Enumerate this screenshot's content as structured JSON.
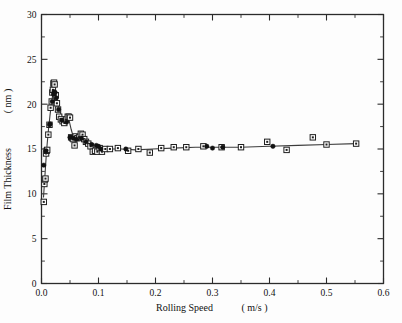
{
  "figure": {
    "background": "#fdfdfd",
    "frame_color": "#2b2b2b",
    "marker_square_label": "open-square-with-center-dot",
    "marker_circle_label": "filled-circle"
  },
  "chart_data": {
    "type": "scatter",
    "title": "",
    "xlabel_name": "Rolling Speed",
    "xlabel_units": "( m/s )",
    "ylabel_name": "Film Thickness",
    "ylabel_units": "( nm )",
    "xlim": [
      0.0,
      0.6
    ],
    "ylim": [
      0,
      30
    ],
    "xticks": [
      0.0,
      0.1,
      0.2,
      0.3,
      0.4,
      0.5,
      0.6
    ],
    "xtick_labels": [
      "0.0",
      "0.1",
      "0.2",
      "0.3",
      "0.4",
      "0.5",
      "0.6"
    ],
    "yticks": [
      0,
      5,
      10,
      15,
      20,
      25,
      30
    ],
    "ytick_labels": [
      "0",
      "5",
      "10",
      "15",
      "20",
      "25",
      "30"
    ],
    "x_minor_step": 0.05,
    "y_minor_step": 2.5,
    "grid": false,
    "legend": "none",
    "tick_direction": "in",
    "series": [
      {
        "name": "squares",
        "marker": "open-square-with-center-dot",
        "x": [
          0.004,
          0.005,
          0.006,
          0.007,
          0.008,
          0.009,
          0.01,
          0.012,
          0.014,
          0.016,
          0.018,
          0.019,
          0.02,
          0.021,
          0.022,
          0.023,
          0.025,
          0.027,
          0.029,
          0.031,
          0.034,
          0.037,
          0.04,
          0.043,
          0.046,
          0.048,
          0.05,
          0.052,
          0.054,
          0.056,
          0.058,
          0.06,
          0.063,
          0.066,
          0.069,
          0.072,
          0.075,
          0.078,
          0.082,
          0.086,
          0.09,
          0.094,
          0.098,
          0.102,
          0.106,
          0.112,
          0.12,
          0.134,
          0.152,
          0.17,
          0.19,
          0.21,
          0.232,
          0.254,
          0.284,
          0.316,
          0.35,
          0.396,
          0.43,
          0.476,
          0.5,
          0.552
        ],
        "y": [
          9.1,
          11.1,
          11.6,
          11.7,
          14.5,
          14.8,
          14.9,
          16.6,
          17.7,
          19.6,
          20.3,
          21.3,
          21.6,
          22.3,
          22.4,
          22.2,
          21.0,
          20.1,
          19.4,
          18.6,
          18.3,
          18.1,
          17.9,
          18.3,
          18.6,
          18.6,
          18.5,
          16.3,
          16.2,
          16.1,
          15.4,
          16.4,
          16.2,
          16.3,
          16.7,
          16.6,
          16.1,
          15.8,
          15.6,
          15.3,
          14.7,
          14.8,
          14.7,
          15.1,
          14.7,
          15.0,
          15.0,
          15.1,
          14.8,
          15.0,
          14.6,
          15.1,
          15.2,
          15.2,
          15.3,
          15.2,
          15.2,
          15.8,
          14.9,
          16.3,
          15.5,
          15.6
        ]
      },
      {
        "name": "circles",
        "marker": "filled-circle",
        "x": [
          0.004,
          0.008,
          0.014,
          0.015,
          0.019,
          0.021,
          0.022,
          0.024,
          0.026,
          0.03,
          0.036,
          0.044,
          0.05,
          0.056,
          0.062,
          0.07,
          0.078,
          0.088,
          0.096,
          0.1,
          0.104,
          0.148,
          0.29,
          0.3,
          0.318,
          0.406
        ],
        "y": [
          13.2,
          14.8,
          17.7,
          17.8,
          20.3,
          21.1,
          21.4,
          21.3,
          20.7,
          19.4,
          18.2,
          18.0,
          16.3,
          16.2,
          16.1,
          16.2,
          15.8,
          15.5,
          15.4,
          15.3,
          15.0,
          15.0,
          15.3,
          15.1,
          15.2,
          15.3
        ]
      }
    ],
    "fit_curve": {
      "name": "trend-line",
      "x": [
        0.0035,
        0.006,
        0.009,
        0.012,
        0.015,
        0.018,
        0.02,
        0.022,
        0.024,
        0.027,
        0.03,
        0.034,
        0.038,
        0.043,
        0.048,
        0.052,
        0.056,
        0.06,
        0.065,
        0.07,
        0.076,
        0.082,
        0.09,
        0.098,
        0.108,
        0.12,
        0.14,
        0.165,
        0.195,
        0.23,
        0.27,
        0.31,
        0.35,
        0.4,
        0.45,
        0.5,
        0.552
      ],
      "y": [
        9.6,
        12.0,
        14.9,
        17.0,
        18.8,
        20.3,
        21.2,
        22.1,
        21.6,
        20.6,
        19.7,
        18.9,
        18.3,
        18.1,
        18.3,
        17.2,
        16.3,
        16.2,
        16.3,
        16.5,
        16.2,
        15.7,
        15.2,
        15.0,
        15.0,
        15.0,
        15.0,
        14.9,
        15.0,
        15.1,
        15.2,
        15.2,
        15.2,
        15.3,
        15.4,
        15.5,
        15.6
      ]
    }
  }
}
